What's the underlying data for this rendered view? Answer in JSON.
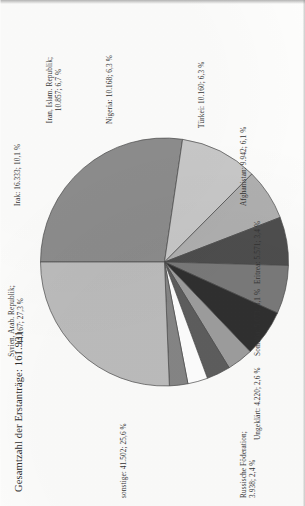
{
  "figure": {
    "title": "Gesamtzahl der Erstanträge: 161.931"
  },
  "chart_data": {
    "type": "pie",
    "title": "Gesamtzahl der Erstanträge: 161.931",
    "total": 161931,
    "total_label": "161.931",
    "unit": "Erstanträge",
    "legend": "none",
    "labels_inline": true,
    "categories": [
      "Syrien, Arab. Republik",
      "Irak",
      "Iran, Islam. Republik",
      "Nigeria",
      "Türkei",
      "Afghanistan",
      "Eritrea",
      "Somalia",
      "Ungeklärt",
      "Russische Föderation",
      "sonstige"
    ],
    "values": [
      44167,
      16333,
      10857,
      10168,
      10160,
      9942,
      5571,
      5073,
      4220,
      3938,
      41502
    ],
    "percentages": [
      27.3,
      10.1,
      6.7,
      6.3,
      6.3,
      6.1,
      3.4,
      3.1,
      2.6,
      2.4,
      25.6
    ],
    "value_labels": [
      "44.167",
      "16.333",
      "10.857",
      "10.168",
      "10.160",
      "9.942",
      "5.571",
      "5.073",
      "4.220",
      "3.938",
      "41.502"
    ],
    "percent_labels": [
      "27,3 %",
      "10,1 %",
      "6,7 %",
      "6,3 %",
      "6,3 %",
      "6,1 %",
      "3,4 %",
      "3,1 %",
      "2,6 %",
      "2,4 %",
      "25,6 %"
    ],
    "colors": [
      "#8d8d8d",
      "#c9c9c9",
      "#b0b0b0",
      "#4e4e4e",
      "#7a7a7a",
      "#303030",
      "#9e9e9e",
      "#5e5e5e",
      "#ffffff",
      "#868686",
      "#bdbdbd"
    ],
    "slice_labels": [
      "Syrien, Arab. Republik;\n44.167; 27,3 %",
      "Irak: 16.333; 10,1 %",
      "Iran, Islam. Republik;\n10.857; 6,7 %",
      "Nigeria: 10.168; 6,3 %",
      "Türkei: 10.160; 6,3 %",
      "Afghanistan: 9.942; 6,1 %",
      "Eritrea: 5.571; 3,4 %",
      "Somalia: 5.073; 3,1 %",
      "Ungeklärt: 4.220; 2,6 %",
      "Russische Föderation;\n3.938; 2,4 %",
      "sonstige: 41.502; 25,6 %"
    ]
  },
  "labels": {
    "syrien": "Syrien, Arab. Republik;",
    "syrien2": "44.167; 27,3 %",
    "irak": "Irak: 16.333; 10,1 %",
    "iran": "Iran, Islam. Republik;",
    "iran2": "10.857; 6,7 %",
    "nigeria": "Nigeria: 10.168; 6,3 %",
    "tuerkei": "Türkei: 10.160; 6,3 %",
    "afghanistan": "Afghanistan: 9.942; 6,1 %",
    "eritrea": "Eritrea: 5.571; 3,4 %",
    "somalia": "Somalia: 5.073; 3,1 %",
    "ungeklaert": "Ungeklärt: 4.220; 2,6 %",
    "russland": "Russische Föderation;",
    "russland2": "3.938; 2,4 %",
    "sonstige": "sonstige: 41.502; 25,6 %"
  }
}
